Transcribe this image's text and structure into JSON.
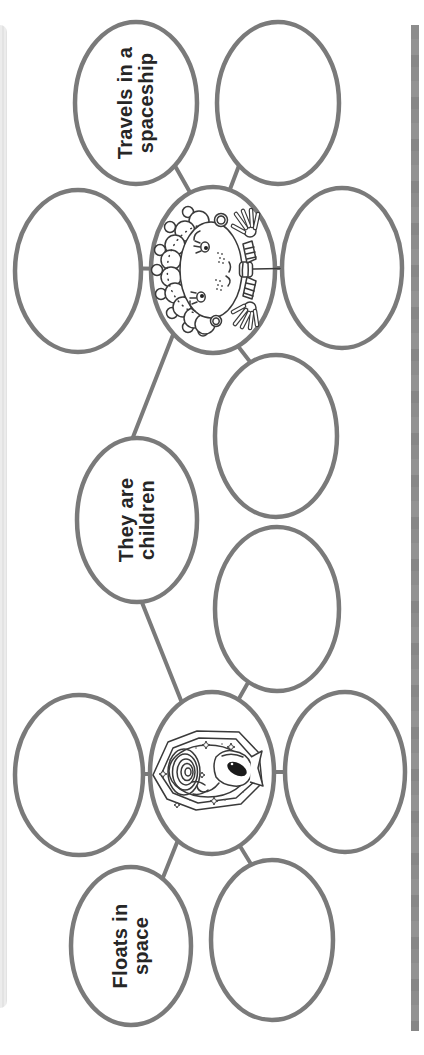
{
  "worksheet": {
    "kind": "mind-map graphic organizer, page rotated 90 degrees",
    "colors": {
      "background": "#ffffff",
      "oval_stroke": "#7a7a7a",
      "label_text": "#262626",
      "right_edge_bar": "#8d8d8d",
      "left_edge_strip": "#e9e9e9"
    },
    "labels": {
      "travels": {
        "line1": "Travels in a",
        "line2": "spaceship"
      },
      "children": {
        "line1": "They are",
        "line2": "children"
      },
      "floats": {
        "line1": "Floats in",
        "line2": "space"
      }
    },
    "central_nodes": [
      {
        "id": "girl-bubble",
        "image": "girl-with-pigtails-waving-hands",
        "connected_labels": [
          "Travels in a spaceship",
          "They are children"
        ],
        "connected_empty_ovals": 4
      },
      {
        "id": "alien-bubble",
        "image": "alien-in-space-portal-with-spiral-and-stars",
        "connected_labels": [
          "They are children",
          "Floats in space"
        ],
        "connected_empty_ovals": 4
      }
    ],
    "empty_oval_count": 8,
    "connector_count": 12
  }
}
